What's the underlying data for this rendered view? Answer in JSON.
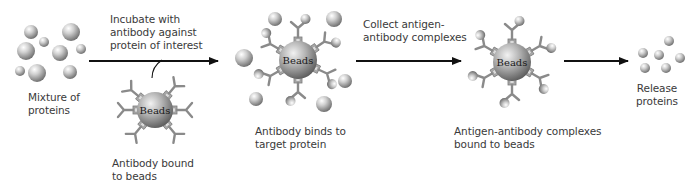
{
  "diagram": {
    "colors": {
      "arrow": "#111111",
      "antibody": "#8a8a8a",
      "bead_light": "#e8e8e8",
      "bead_dark": "#6e6e6e",
      "protein_light": "#f4f4f4",
      "protein_dark": "#7a7a7a",
      "text": "#3a3a3a"
    },
    "bead_label": "Beads",
    "steps": [
      {
        "id": "mixture",
        "label_lines": [
          "Mixture of",
          "proteins"
        ]
      },
      {
        "id": "antibody-beads",
        "label_lines": [
          "Antibody bound",
          "to beads"
        ]
      },
      {
        "id": "binding",
        "label_lines": [
          "Antibody binds to",
          "target protein"
        ]
      },
      {
        "id": "complexes",
        "label_lines": [
          "Antigen-antibody complexes",
          "bound to beads"
        ]
      },
      {
        "id": "release",
        "label_lines": [
          "Release",
          "proteins"
        ]
      }
    ],
    "arrows": [
      {
        "id": "incubate",
        "label_lines": [
          "Incubate with",
          "antibody against",
          "protein of interest"
        ]
      },
      {
        "id": "collect",
        "label_lines": [
          "Collect antigen-",
          "antibody complexes"
        ]
      },
      {
        "id": "release",
        "label_lines": []
      }
    ]
  }
}
